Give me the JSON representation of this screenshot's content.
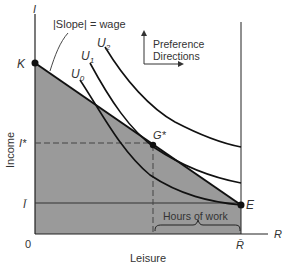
{
  "diagram": {
    "type": "labor-leisure choice",
    "axes": {
      "y_axis_symbol": "I",
      "y_axis_label": "Income",
      "x_axis_symbol": "R",
      "x_axis_label": "Leisure",
      "origin": "0"
    },
    "points": {
      "K": "K",
      "E": "E",
      "G": "G*"
    },
    "y_ticks": {
      "I_star": "I*",
      "I_bar": "Ī"
    },
    "x_ticks": {
      "R_bar": "R̄"
    },
    "curves": {
      "U0": "U",
      "U0_sub": "0",
      "U1": "U",
      "U1_sub": "1",
      "U2": "U",
      "U2_sub": "2"
    },
    "annotations": {
      "slope": "|Slope| = wage",
      "preference_line1": "Preference",
      "preference_line2": "Directions",
      "hours_of_work": "Hours of work"
    },
    "colors": {
      "shaded_region": "#9a9a9a",
      "line": "#222222",
      "text": "#333333"
    }
  }
}
